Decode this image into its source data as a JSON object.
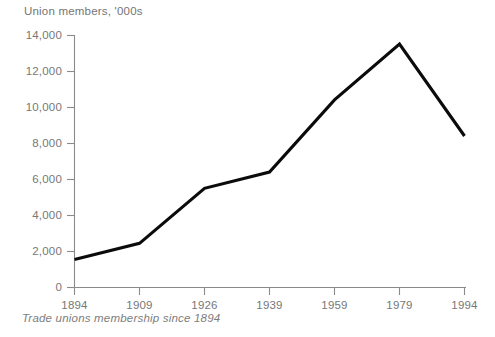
{
  "chart_data": {
    "type": "line",
    "title": "Union members, '000s",
    "caption": "Trade unions membership since 1894",
    "xlabel": "",
    "ylabel": "Union members, '000s",
    "categories": [
      "1894",
      "1909",
      "1926",
      "1939",
      "1959",
      "1979",
      "1994"
    ],
    "x": [
      1894,
      1909,
      1926,
      1939,
      1959,
      1979,
      1994
    ],
    "values": [
      1550,
      2450,
      5500,
      6400,
      10400,
      13500,
      8400
    ],
    "series": [
      {
        "name": "Union members",
        "values": [
          1550,
          2450,
          5500,
          6400,
          10400,
          13500,
          8400
        ]
      }
    ],
    "ylim": [
      0,
      14000
    ],
    "yticks": [
      0,
      2000,
      4000,
      6000,
      8000,
      10000,
      12000,
      14000
    ],
    "ytick_labels": [
      "0",
      "2,000",
      "4,000",
      "6,000",
      "8,000",
      "10,000",
      "12,000",
      "14,000"
    ],
    "xtick_labels": [
      "1894",
      "1909",
      "1926",
      "1939",
      "1959",
      "1979",
      "1994"
    ],
    "grid": false,
    "legend": false,
    "line_color": "#0b0b0b",
    "axis_color": "#8a8a8a",
    "text_color": "#777777"
  }
}
